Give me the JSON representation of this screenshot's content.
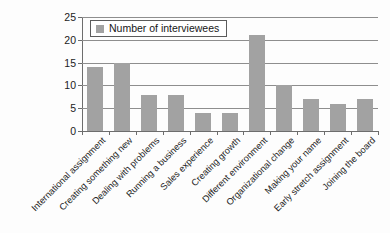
{
  "chart_data": {
    "type": "bar",
    "title": "",
    "subtitle": "",
    "xlabel": "",
    "ylabel": "",
    "ylim": [
      0,
      25
    ],
    "yticks": [
      0,
      5,
      10,
      15,
      20,
      25
    ],
    "grid": true,
    "legend_position": "top-left",
    "orientation": "vertical",
    "categories": [
      "International assignment",
      "Creating something new",
      "Dealing with problems",
      "Running a business",
      "Sales experience",
      "Creating growth",
      "Different environment",
      "Organizational change",
      "Making your name",
      "Early stretch assignment",
      "Joining the board"
    ],
    "series": [
      {
        "name": "Number of interviewees",
        "color": "#a2a2a2",
        "values": [
          14,
          15,
          8,
          8,
          4,
          4,
          21,
          10,
          7,
          6,
          7
        ]
      }
    ]
  },
  "legend": {
    "entries": [
      {
        "label": "Number of interviewees",
        "swatch_color": "#a2a2a2"
      }
    ]
  },
  "axes": {
    "y": {
      "tick_labels": [
        "0",
        "5",
        "10",
        "15",
        "20",
        "25"
      ],
      "min": 0,
      "max": 25
    },
    "x": {
      "tick_labels": [
        "International assignment",
        "Creating something new",
        "Dealing with problems",
        "Running a business",
        "Sales experience",
        "Creating growth",
        "Different environment",
        "Organizational change",
        "Making your name",
        "Early stretch assignment",
        "Joining the board"
      ],
      "label_rotation_deg": -45
    }
  },
  "style": {
    "background": "#fdfdfd",
    "bar_color": "#a2a2a2",
    "gridline_color": "#8e8e8e",
    "axis_color": "#6d6d6d",
    "text_color": "#1b1b1b"
  }
}
